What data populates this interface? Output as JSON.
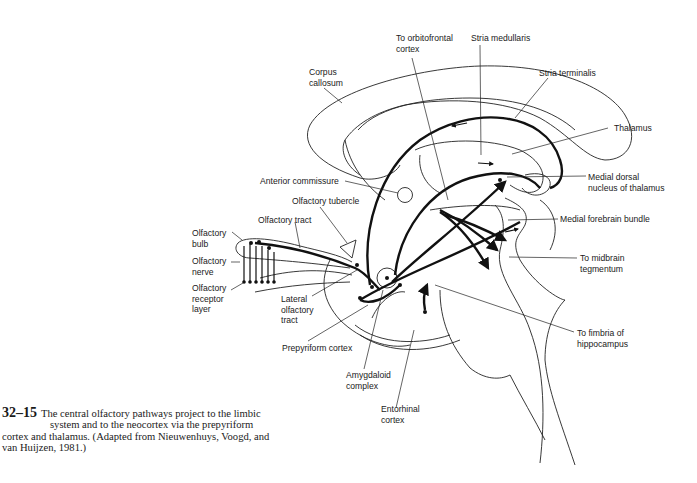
{
  "figure": {
    "number": "32–15",
    "caption_lines": [
      "The central olfactory pathways project to the limbic",
      "system and to the neocortex via the prepyriform",
      "cortex and thalamus. (Adapted from Nieuwenhuys, Voogd, and",
      "van Huijzen, 1981.)"
    ]
  },
  "labels": {
    "to_orbitofrontal": "To orbitofrontal\ncortex",
    "stria_medullaris": "Stria medullaris",
    "stria_terminalis": "Stria terminalis",
    "corpus_callosum": "Corpus\ncallosum",
    "thalamus": "Thalamus",
    "medial_dorsal": "Medial dorsal\nnucleus of thalamus",
    "anterior_commissure": "Anterior commissure",
    "olfactory_tubercle": "Olfactory tubercle",
    "olfactory_tract": "Olfactory tract",
    "medial_forebrain_bundle": "Medial forebrain bundle",
    "olfactory_bulb": "Olfactory\nbulb",
    "olfactory_nerve": "Olfactory\nnerve",
    "olfactory_receptor_layer": "Olfactory\nreceptor\nlayer",
    "to_midbrain": "To midbrain\ntegmentum",
    "lateral_olfactory_tract": "Lateral\nolfactory\ntract",
    "to_fimbria": "To fimbria of\nhippocampus",
    "prepyriform_cortex": "Prepyriform cortex",
    "amygdaloid_complex": "Amygdaloid\ncomplex",
    "entorhinal_cortex": "Entorhinal\ncortex"
  }
}
